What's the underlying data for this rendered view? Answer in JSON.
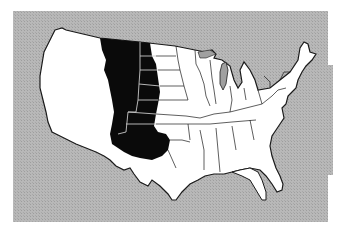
{
  "map": {
    "subject": "Contiguous United States with Great Plains region highlighted",
    "colors": {
      "background": "#ffffff",
      "water": "#b4b4b4",
      "land": "#ffffff",
      "highlight": "#0a0a0a",
      "border": "#1a1a1a",
      "highlight_border": "#c8c8c8"
    },
    "regions": [
      {
        "name": "Great Plains",
        "highlighted": true
      }
    ]
  }
}
